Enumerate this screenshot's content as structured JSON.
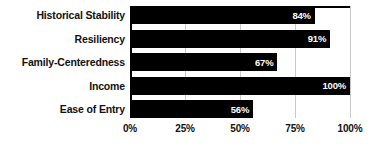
{
  "chart_data": {
    "type": "bar",
    "orientation": "horizontal",
    "title": "",
    "subtitle": "",
    "xlabel": "",
    "ylabel": "",
    "categories": [
      "Historical Stability",
      "Resiliency",
      "Family-Centeredness",
      "Income",
      "Ease of Entry"
    ],
    "values": [
      84,
      91,
      67,
      100,
      56
    ],
    "value_labels": [
      "84%",
      "91%",
      "67%",
      "100%",
      "56%"
    ],
    "xlim": [
      0,
      100
    ],
    "x_ticks": [
      0,
      25,
      50,
      75,
      100
    ],
    "x_tick_labels": [
      "0%",
      "25%",
      "50%",
      "75%",
      "100%"
    ],
    "grid": true,
    "grid_axis": "x",
    "legend": false,
    "legend_position": "none",
    "colors": {
      "bar": "#000000",
      "bar_label": "#ffffff",
      "gridline": "#c9c9c9",
      "axis": "#000000",
      "text": "#111111",
      "background": "#ffffff"
    }
  }
}
